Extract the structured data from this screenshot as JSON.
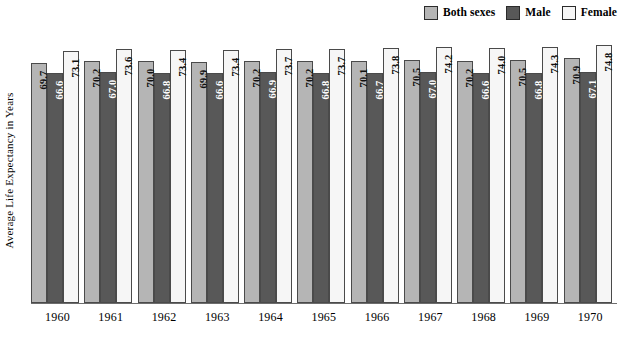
{
  "chart_data": {
    "type": "bar",
    "title": "",
    "subtitle": "",
    "xlabel": "",
    "ylabel": "Average Life Expectancy in Years",
    "grid": false,
    "legend_position": "top-right",
    "ylim": [
      0,
      80
    ],
    "categories": [
      "1960",
      "1961",
      "1962",
      "1963",
      "1964",
      "1965",
      "1966",
      "1967",
      "1968",
      "1969",
      "1970"
    ],
    "series": [
      {
        "name": "Both sexes",
        "color": "#b5b5b5",
        "values": [
          69.7,
          70.2,
          70.0,
          69.9,
          70.2,
          70.2,
          70.1,
          70.5,
          70.2,
          70.5,
          70.9
        ]
      },
      {
        "name": "Male",
        "color": "#585858",
        "values": [
          66.6,
          67.0,
          66.8,
          66.6,
          66.9,
          66.8,
          66.7,
          67.0,
          66.6,
          66.8,
          67.1
        ]
      },
      {
        "name": "Female",
        "color": "#f6f6f6",
        "values": [
          73.1,
          73.6,
          73.4,
          73.4,
          73.7,
          73.7,
          73.8,
          74.2,
          74.0,
          74.3,
          74.8
        ]
      }
    ]
  },
  "legend": {
    "items": [
      {
        "label": "Both sexes",
        "color": "#b5b5b5"
      },
      {
        "label": "Male",
        "color": "#585858"
      },
      {
        "label": "Female",
        "color": "#f6f6f6"
      }
    ]
  },
  "axes": {
    "y_title": "Average Life Expectancy in Years"
  }
}
